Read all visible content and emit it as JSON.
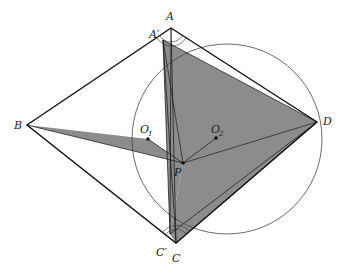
{
  "diagram": {
    "type": "geometry",
    "points": {
      "A": {
        "label": "A",
        "x": 171,
        "y": 28
      },
      "A_prime": {
        "label": "A′",
        "x": 163,
        "y": 40
      },
      "B": {
        "label": "B",
        "x": 27,
        "y": 125
      },
      "C": {
        "label": "C",
        "x": 176,
        "y": 243
      },
      "C_prime": {
        "label": "C′",
        "x": 170,
        "y": 234
      },
      "D": {
        "label": "D",
        "x": 317,
        "y": 122
      },
      "P": {
        "label": "P",
        "x": 183,
        "y": 163
      },
      "O1": {
        "label": "O",
        "sub": "1",
        "x": 148,
        "y": 139
      },
      "O2": {
        "label": "O",
        "sub": "2",
        "x": 216,
        "y": 138
      }
    },
    "circle": {
      "cx": 227,
      "cy": 139,
      "r": 95
    },
    "colors": {
      "fill": "#8c8c8c",
      "stroke": "#111111",
      "circle": "#444444"
    }
  }
}
